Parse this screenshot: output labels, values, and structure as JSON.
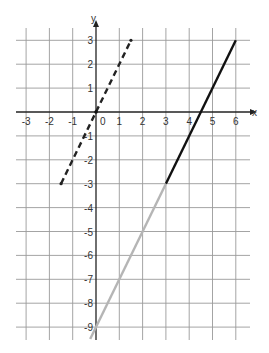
{
  "chart_data": {
    "type": "line",
    "title": "",
    "xlabel": "x",
    "ylabel": "y",
    "xlim": [
      -3.5,
      6.5
    ],
    "ylim": [
      -9.5,
      3.5
    ],
    "grid": true,
    "x_ticks": [
      -3,
      -2,
      -1,
      0,
      1,
      2,
      3,
      4,
      5,
      6
    ],
    "x_tick_labels": [
      "-3",
      "-2",
      "-1",
      "0",
      "1",
      "2",
      "3",
      "4",
      "5",
      "6"
    ],
    "y_ticks": [
      3,
      2,
      1,
      -1,
      -2,
      -3,
      -4,
      -5,
      -6,
      -7,
      -8,
      -9
    ],
    "y_tick_labels": [
      "3",
      "2",
      "1",
      "-1",
      "-2",
      "-3",
      "-4",
      "-5",
      "-6",
      "-7",
      "-8",
      "-9"
    ],
    "series": [
      {
        "name": "dashed line y=2x",
        "style": "dashed",
        "color": "#222222",
        "x": [
          -1.5,
          1.5
        ],
        "y": [
          -3,
          3
        ]
      },
      {
        "name": "solid black segment",
        "style": "solid",
        "color": "#111111",
        "x": [
          3,
          6
        ],
        "y": [
          -3,
          3
        ]
      },
      {
        "name": "gray segment",
        "style": "solid",
        "color": "#b5b5b5",
        "x": [
          -0.25,
          3
        ],
        "y": [
          -9.5,
          -3
        ]
      }
    ],
    "legend": null
  },
  "axes": {
    "x_label": "x",
    "y_label": "y"
  }
}
